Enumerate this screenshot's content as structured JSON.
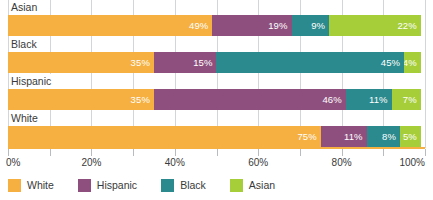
{
  "chart_data": {
    "type": "bar",
    "orientation": "horizontal",
    "stacked": true,
    "stack_mode": "percent",
    "title": "",
    "subtitle": "",
    "xlabel": "",
    "ylabel": "",
    "xlim": [
      0,
      100
    ],
    "xticks": [
      0,
      20,
      40,
      60,
      80,
      100
    ],
    "xtick_labels": [
      "0%",
      "20%",
      "40%",
      "60%",
      "80%",
      "100%"
    ],
    "minor_tick_interval": 10,
    "grid": true,
    "grid_axis": "x",
    "legend_position": "bottom-left",
    "categories": [
      "Asian",
      "Black",
      "Hispanic",
      "White"
    ],
    "series": [
      {
        "name": "White",
        "color": "#f5b041",
        "values": [
          49,
          35,
          35,
          75
        ]
      },
      {
        "name": "Hispanic",
        "color": "#8e4f7e",
        "values": [
          19,
          15,
          46,
          11
        ]
      },
      {
        "name": "Black",
        "color": "#2a8a8e",
        "values": [
          9,
          45,
          11,
          8
        ]
      },
      {
        "name": "Asian",
        "color": "#a6ce39",
        "values": [
          22,
          4,
          7,
          5
        ]
      }
    ],
    "rows": [
      {
        "label": "Asian",
        "segments": [
          {
            "name": "White",
            "value": 49,
            "label": "49%",
            "color": "#f5b041"
          },
          {
            "name": "Hispanic",
            "value": 19,
            "label": "19%",
            "color": "#8e4f7e"
          },
          {
            "name": "Black",
            "value": 9,
            "label": "9%",
            "color": "#2a8a8e"
          },
          {
            "name": "Asian",
            "value": 22,
            "label": "22%",
            "color": "#a6ce39"
          }
        ]
      },
      {
        "label": "Black",
        "segments": [
          {
            "name": "White",
            "value": 35,
            "label": "35%",
            "color": "#f5b041"
          },
          {
            "name": "Hispanic",
            "value": 15,
            "label": "15%",
            "color": "#8e4f7e"
          },
          {
            "name": "Black",
            "value": 45,
            "label": "45%",
            "color": "#2a8a8e"
          },
          {
            "name": "Asian",
            "value": 4,
            "label": "4%",
            "color": "#a6ce39"
          }
        ]
      },
      {
        "label": "Hispanic",
        "segments": [
          {
            "name": "White",
            "value": 35,
            "label": "35%",
            "color": "#f5b041"
          },
          {
            "name": "Hispanic",
            "value": 46,
            "label": "46%",
            "color": "#8e4f7e"
          },
          {
            "name": "Black",
            "value": 11,
            "label": "11%",
            "color": "#2a8a8e"
          },
          {
            "name": "Asian",
            "value": 7,
            "label": "7%",
            "color": "#a6ce39"
          }
        ]
      },
      {
        "label": "White",
        "segments": [
          {
            "name": "White",
            "value": 75,
            "label": "75%",
            "color": "#f5b041"
          },
          {
            "name": "Hispanic",
            "value": 11,
            "label": "11%",
            "color": "#8e4f7e"
          },
          {
            "name": "Black",
            "value": 8,
            "label": "8%",
            "color": "#2a8a8e"
          },
          {
            "name": "Asian",
            "value": 5,
            "label": "5%",
            "color": "#a6ce39"
          }
        ]
      }
    ],
    "legend": [
      {
        "label": "White",
        "color": "#f5b041"
      },
      {
        "label": "Hispanic",
        "color": "#8e4f7e"
      },
      {
        "label": "Black",
        "color": "#2a8a8e"
      },
      {
        "label": "Asian",
        "color": "#a6ce39"
      }
    ]
  },
  "colors": {
    "white_series": "#f5b041",
    "hispanic_series": "#8e4f7e",
    "black_series": "#2a8a8e",
    "asian_series": "#a6ce39",
    "axis_line": "#f5b041",
    "gridline": "#d3d6d8",
    "text": "#3a3a3a",
    "data_label_text": "#ffffff",
    "background": "#ffffff"
  }
}
